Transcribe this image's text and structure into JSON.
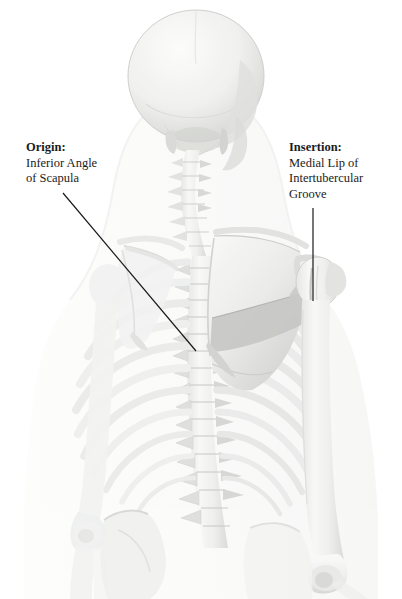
{
  "figure": {
    "view": "posterior",
    "background_color": "#ffffff",
    "bone_color": "#f2f2f0",
    "bone_shadow_color": "#cfd0cd",
    "body_silhouette_color": "#fbfbfa",
    "regions": [
      "skull",
      "cervical-spine",
      "thoracic-spine",
      "lumbar-spine",
      "rib-cage",
      "left-scapula",
      "right-scapula",
      "left-humerus",
      "right-humerus",
      "left-clavicle",
      "right-clavicle",
      "pelvis"
    ]
  },
  "callouts": {
    "origin": {
      "heading": "Origin:",
      "lines": [
        "Inferior Angle",
        "of Scapula"
      ],
      "leader": {
        "x1": 63,
        "y1": 193,
        "x2": 196,
        "y2": 351,
        "color": "#1a1a1a",
        "width": 1.2
      }
    },
    "insertion": {
      "heading": "Insertion:",
      "lines": [
        "Medial Lip of",
        "Intertubercular",
        "Groove"
      ],
      "leader": {
        "x1": 313,
        "y1": 208,
        "x2": 313,
        "y2": 301,
        "color": "#1a1a1a",
        "width": 1.2
      }
    }
  },
  "colors": {
    "text": "#1b1b1b",
    "leader_line": "#1a1a1a",
    "page_background": "#ffffff"
  }
}
